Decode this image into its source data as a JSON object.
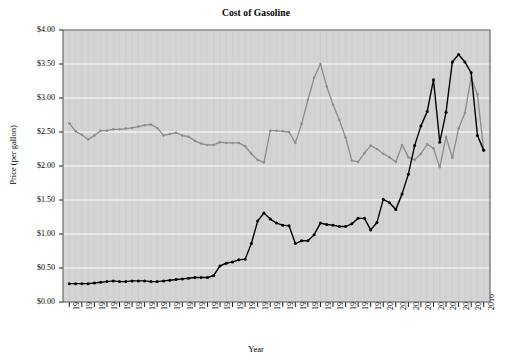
{
  "chart_data": {
    "type": "line",
    "title": "Cost of Gasoline",
    "xlabel": "Year",
    "ylabel": "Price (per gallon)",
    "xlim": [
      1949,
      2017
    ],
    "ylim": [
      0,
      4.0
    ],
    "grid": true,
    "legend_position": "inline-annotations",
    "plot_background": "#d4d4d4",
    "y_tick_labels": [
      "$0.00",
      "$0.50",
      "$1.00",
      "$1.50",
      "$2.00",
      "$2.50",
      "$3.00",
      "$3.50",
      "$4.00"
    ],
    "y_tick_values": [
      0,
      0.5,
      1.0,
      1.5,
      2.0,
      2.5,
      3.0,
      3.5,
      4.0
    ],
    "x_tick_labels": [
      "1950",
      "1952",
      "1954",
      "1956",
      "1958",
      "1960",
      "1962",
      "1964",
      "1966",
      "1968",
      "1970",
      "1972",
      "1974",
      "1976",
      "1978",
      "1980",
      "1982",
      "1984",
      "1986",
      "1988",
      "1990",
      "1992",
      "1994",
      "1996",
      "1998",
      "2000",
      "2002",
      "2004",
      "2006",
      "2008",
      "2010",
      "2012",
      "2014",
      "2016"
    ],
    "x_tick_values": [
      1950,
      1952,
      1954,
      1956,
      1958,
      1960,
      1962,
      1964,
      1966,
      1968,
      1970,
      1972,
      1974,
      1976,
      1978,
      1980,
      1982,
      1984,
      1986,
      1988,
      1990,
      1992,
      1994,
      1996,
      1998,
      2000,
      2002,
      2004,
      2006,
      2008,
      2010,
      2012,
      2014,
      2016
    ],
    "x": [
      1950,
      1951,
      1952,
      1953,
      1954,
      1955,
      1956,
      1957,
      1958,
      1959,
      1960,
      1961,
      1962,
      1963,
      1964,
      1965,
      1966,
      1967,
      1968,
      1969,
      1970,
      1971,
      1972,
      1973,
      1974,
      1975,
      1976,
      1977,
      1978,
      1979,
      1980,
      1981,
      1982,
      1983,
      1984,
      1985,
      1986,
      1987,
      1988,
      1989,
      1990,
      1991,
      1992,
      1993,
      1994,
      1995,
      1996,
      1997,
      1998,
      1999,
      2000,
      2001,
      2002,
      2003,
      2004,
      2005,
      2006,
      2007,
      2008,
      2009,
      2010,
      2011,
      2012,
      2013,
      2014,
      2015,
      2016
    ],
    "series": [
      {
        "name": "2016 dollars",
        "color": "#8c8c8c",
        "marker": "circle",
        "annotation_label": "2016 dollars",
        "values": [
          2.63,
          2.51,
          2.46,
          2.39,
          2.45,
          2.52,
          2.52,
          2.54,
          2.54,
          2.55,
          2.56,
          2.58,
          2.6,
          2.61,
          2.56,
          2.45,
          2.47,
          2.49,
          2.45,
          2.43,
          2.37,
          2.33,
          2.31,
          2.31,
          2.35,
          2.34,
          2.34,
          2.34,
          2.29,
          2.18,
          2.09,
          2.05,
          2.52,
          2.52,
          2.51,
          2.5,
          2.34,
          2.62,
          2.97,
          3.3,
          3.5,
          3.17,
          2.9,
          2.68,
          2.42,
          2.08,
          2.06,
          2.19,
          2.3,
          2.25,
          2.18,
          2.13,
          2.06,
          2.31,
          2.13,
          2.09,
          2.18,
          2.32,
          2.26,
          1.98,
          2.43,
          2.12,
          2.55,
          2.78,
          3.3,
          3.05,
          2.23
        ]
      },
      {
        "name": "Actual prices",
        "color": "#000000",
        "marker": "circle",
        "annotation_label": "Actual prices",
        "values": [
          0.27,
          0.27,
          0.27,
          0.27,
          0.28,
          0.29,
          0.3,
          0.31,
          0.3,
          0.3,
          0.31,
          0.31,
          0.31,
          0.3,
          0.3,
          0.31,
          0.32,
          0.33,
          0.34,
          0.35,
          0.36,
          0.36,
          0.36,
          0.39,
          0.53,
          0.57,
          0.59,
          0.62,
          0.63,
          0.86,
          1.19,
          1.31,
          1.22,
          1.16,
          1.13,
          1.12,
          0.86,
          0.9,
          0.9,
          0.99,
          1.16,
          1.14,
          1.13,
          1.11,
          1.11,
          1.15,
          1.23,
          1.23,
          1.06,
          1.17,
          1.51,
          1.46,
          1.36,
          1.59,
          1.88,
          2.3,
          2.59,
          2.8,
          3.27,
          2.35,
          2.79,
          3.53,
          3.64,
          3.53,
          3.37,
          2.45,
          2.23
        ]
      }
    ],
    "annotations": [
      {
        "text": "2016 dollars",
        "x_px": 128,
        "y_px": 114
      },
      {
        "text": "Actual prices",
        "x_px": 78,
        "y_px": 262
      }
    ]
  },
  "figure": {
    "title": "Cost of Gasoline",
    "xlabel": "Year",
    "ylabel": "Price (per gallon)"
  }
}
